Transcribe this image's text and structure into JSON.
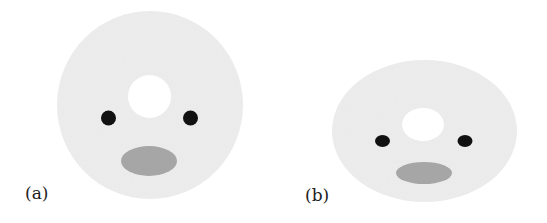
{
  "figure": {
    "panels": [
      {
        "label": "(a)",
        "shape": "circle",
        "disk": {
          "cx": 150,
          "cy": 105,
          "rx": 93,
          "ry": 94
        },
        "hole": {
          "cx": 149.5,
          "cy": 96.5,
          "rx": 21.5,
          "ry": 21.5
        },
        "eye_left": {
          "cx": 108.5,
          "cy": 118,
          "rx": 7.5,
          "ry": 7.5
        },
        "eye_right": {
          "cx": 190.5,
          "cy": 118,
          "rx": 7.5,
          "ry": 7.5
        },
        "mouth": {
          "cx": 149,
          "cy": 161,
          "rx": 28,
          "ry": 15
        }
      },
      {
        "label": "(b)",
        "shape": "ellipse",
        "disk": {
          "cx": 424.5,
          "cy": 131,
          "rx": 92.5,
          "ry": 71
        },
        "hole": {
          "cx": 423,
          "cy": 124.5,
          "rx": 21,
          "ry": 16.5
        },
        "eye_left": {
          "cx": 382.5,
          "cy": 141,
          "rx": 7.5,
          "ry": 6
        },
        "eye_right": {
          "cx": 465,
          "cy": 141,
          "rx": 7.5,
          "ry": 6
        },
        "mouth": {
          "cx": 424,
          "cy": 173,
          "rx": 28,
          "ry": 11
        }
      }
    ],
    "colors": {
      "disk": "#eeeeee",
      "hole": "#ffffff",
      "eye": "#111111",
      "mouth": "#a6a6a6",
      "label": "#222222"
    }
  }
}
